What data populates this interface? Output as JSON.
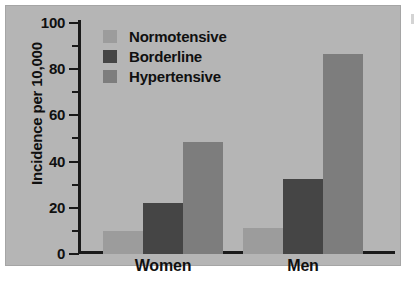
{
  "figure": {
    "panel_color": "#b5b5b5",
    "page_color": "#ffffff",
    "axis_color": "#1a1a1a"
  },
  "legend": {
    "position": "top-left-inside",
    "items": [
      {
        "label": "Normotensive",
        "color": "#9c9c9c"
      },
      {
        "label": "Borderline",
        "color": "#454545"
      },
      {
        "label": "Hypertensive",
        "color": "#7d7d7d"
      }
    ]
  },
  "axes": {
    "ylabel": "Incidence per 10,000",
    "yticks": [
      "0",
      "20",
      "40",
      "60",
      "80",
      "100"
    ],
    "xticks": [
      "Women",
      "Men"
    ]
  },
  "chart_data": {
    "type": "bar",
    "title": "",
    "xlabel": "",
    "ylabel": "Incidence per 10,000",
    "categories": [
      "Women",
      "Men"
    ],
    "series": [
      {
        "name": "Normotensive",
        "color": "#9c9c9c",
        "values": [
          10,
          11
        ]
      },
      {
        "name": "Borderline",
        "color": "#454545",
        "values": [
          22,
          32
        ]
      },
      {
        "name": "Hypertensive",
        "color": "#7d7d7d",
        "values": [
          48,
          86
        ]
      }
    ],
    "ylim": [
      0,
      100
    ],
    "ytick_values": [
      0,
      20,
      40,
      60,
      80,
      100
    ],
    "yminor_tick_values": [
      10,
      30,
      50,
      70,
      90
    ],
    "grid": false,
    "legend_position": "upper left (inside axes)",
    "bar_grouping": "grouped-adjacent"
  }
}
